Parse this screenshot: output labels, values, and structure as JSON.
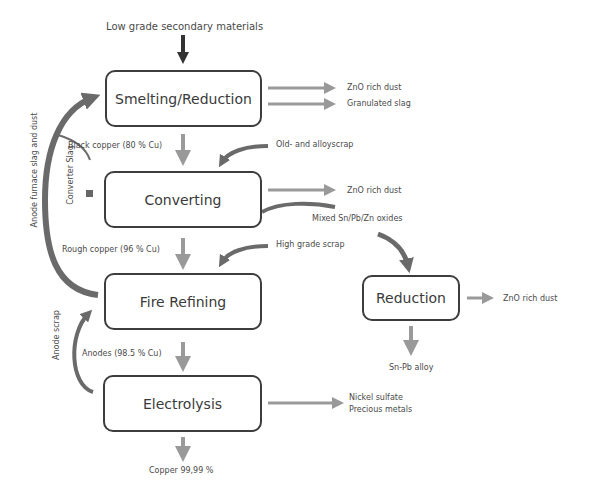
{
  "title_input": "Low grade secondary materials",
  "boxes": {
    "smelting": "Smelting/Reduction",
    "converting": "Converting",
    "fire_refining": "Fire Refining",
    "electrolysis": "Electrolysis",
    "reduction": "Reduction"
  },
  "outputs": {
    "smelting_1": "ZnO rich dust",
    "smelting_2": "Granulated slag",
    "converting_1": "ZnO rich dust",
    "converting_2": "Mixed Sn/Pb/Zn oxides",
    "reduction_1": "ZnO rich dust",
    "reduction_2": "Sn-Pb alloy",
    "electrolysis_1": "Nickel sulfate",
    "electrolysis_2": "Precious metals",
    "final": "Copper 99,99 %"
  },
  "flows": {
    "black_copper": "Black copper (80 % Cu)",
    "rough_copper": "Rough copper (96 % Cu)",
    "anodes": "Anodes (98.5 % Cu)"
  },
  "inputs": {
    "old_alloy_scrap": "Old- and alloyscrap",
    "high_grade_scrap": "High grade scrap"
  },
  "recycles": {
    "anode_furnace": "Anode furnace slag and dust",
    "converter_slag": "Converter Slag",
    "anode_scrap": "Anode scrap"
  },
  "colors": {
    "box_border": "#3d3d3d",
    "arrow_light": "#9a9a9a",
    "arrow_dark": "#6a6a6a"
  }
}
